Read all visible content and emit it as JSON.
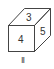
{
  "diagram": {
    "type": "cube",
    "faces": {
      "top": "3",
      "front": "4",
      "right": "5"
    },
    "caption": "II",
    "stroke_color": "#444444"
  }
}
